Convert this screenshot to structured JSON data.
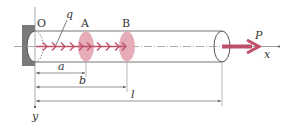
{
  "diagram": {
    "type": "beam-axial-load",
    "labels": {
      "origin": "O",
      "point_a": "A",
      "point_b": "B",
      "distributed_load": "q",
      "force": "P",
      "x_axis": "x",
      "y_axis": "y"
    },
    "dimensions": [
      {
        "label": "a",
        "from": "O",
        "to": "A"
      },
      {
        "label": "b",
        "from": "O",
        "to": "B"
      },
      {
        "label": "l",
        "from": "O",
        "to": "free end"
      }
    ],
    "colors": {
      "load": "#c0506a",
      "section_fill": "#e3a3b0",
      "outline": "#555555",
      "wall": "#777777",
      "dim_line": "#666666"
    }
  }
}
